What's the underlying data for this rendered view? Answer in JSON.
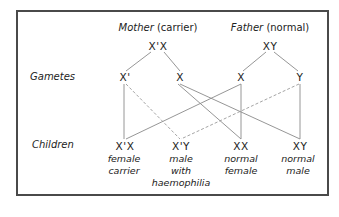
{
  "parents": {
    "mother": {
      "role": "Mother",
      "status": "(carrier)",
      "genotype": "X'X"
    },
    "father": {
      "role": "Father",
      "status": "(normal)",
      "genotype": "XY"
    }
  },
  "row_labels": {
    "gametes": "Gametes",
    "children": "Children"
  },
  "gametes": [
    {
      "id": "mother-xprime",
      "label": "X'"
    },
    {
      "id": "mother-x",
      "label": "X"
    },
    {
      "id": "father-x",
      "label": "X"
    },
    {
      "id": "father-y",
      "label": "Y"
    }
  ],
  "children": [
    {
      "genotype": "X'X",
      "desc": [
        "female",
        "carrier"
      ]
    },
    {
      "genotype": "X'Y",
      "desc": [
        "male",
        "with",
        "haemophilia"
      ]
    },
    {
      "genotype": "XX",
      "desc": [
        "normal",
        "female"
      ]
    },
    {
      "genotype": "XY",
      "desc": [
        "normal",
        "male"
      ]
    }
  ],
  "connections": [
    {
      "from": "X'X",
      "to": "mother-xprime",
      "style": "solid"
    },
    {
      "from": "X'X",
      "to": "mother-x",
      "style": "solid"
    },
    {
      "from": "XY",
      "to": "father-x",
      "style": "solid"
    },
    {
      "from": "XY",
      "to": "father-y",
      "style": "solid"
    },
    {
      "from": "mother-xprime",
      "to": "child-X'X",
      "style": "solid"
    },
    {
      "from": "mother-xprime",
      "to": "child-X'Y",
      "style": "dashed"
    },
    {
      "from": "mother-x",
      "to": "child-XX",
      "style": "solid"
    },
    {
      "from": "mother-x",
      "to": "child-XY",
      "style": "solid"
    },
    {
      "from": "father-x",
      "to": "child-X'X",
      "style": "solid"
    },
    {
      "from": "father-x",
      "to": "child-XX",
      "style": "solid"
    },
    {
      "from": "father-y",
      "to": "child-X'Y",
      "style": "dashed"
    },
    {
      "from": "father-y",
      "to": "child-XY",
      "style": "solid"
    }
  ],
  "colors": {
    "border": "#4a4a4a",
    "line": "#888888",
    "dashed": "#999999",
    "text": "#222222"
  }
}
